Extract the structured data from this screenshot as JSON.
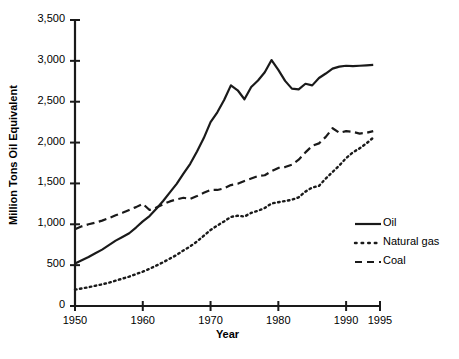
{
  "chart_data": {
    "type": "line",
    "title": "",
    "xlabel": "Year",
    "ylabel": "Million Tons Oil Equivalent",
    "xlim": [
      1950,
      1995
    ],
    "ylim": [
      0,
      3500
    ],
    "xticks": [
      1950,
      1960,
      1970,
      1980,
      1990,
      1995
    ],
    "xtick_labels": [
      "1950",
      "1960",
      "1970",
      "1980",
      "1990",
      "1995"
    ],
    "yticks": [
      0,
      500,
      1000,
      1500,
      2000,
      2500,
      3000,
      3500
    ],
    "ytick_labels": [
      "0",
      "500",
      "1,000",
      "1,500",
      "2,000",
      "2,500",
      "3,000",
      "3,500"
    ],
    "grid": false,
    "legend_position": "center-right",
    "x": [
      1950,
      1951,
      1952,
      1953,
      1954,
      1955,
      1956,
      1957,
      1958,
      1959,
      1960,
      1961,
      1962,
      1963,
      1964,
      1965,
      1966,
      1967,
      1968,
      1969,
      1970,
      1971,
      1972,
      1973,
      1974,
      1975,
      1976,
      1977,
      1978,
      1979,
      1980,
      1981,
      1982,
      1983,
      1984,
      1985,
      1986,
      1987,
      1988,
      1989,
      1990,
      1991,
      1992,
      1993,
      1994
    ],
    "series": [
      {
        "name": "Oil",
        "style": "solid",
        "color": "#1a1a1a",
        "values": [
          520,
          560,
          600,
          645,
          690,
          745,
          800,
          845,
          890,
          960,
          1035,
          1100,
          1190,
          1285,
          1390,
          1495,
          1620,
          1740,
          1890,
          2055,
          2250,
          2370,
          2520,
          2700,
          2640,
          2530,
          2680,
          2760,
          2860,
          3010,
          2890,
          2755,
          2660,
          2650,
          2720,
          2700,
          2790,
          2845,
          2905,
          2930,
          2940,
          2935,
          2940,
          2945,
          2950
        ]
      },
      {
        "name": "Natural gas",
        "style": "dotted",
        "color": "#1a1a1a",
        "values": [
          200,
          215,
          230,
          248,
          265,
          285,
          310,
          335,
          360,
          390,
          420,
          455,
          495,
          535,
          580,
          625,
          680,
          730,
          790,
          860,
          930,
          985,
          1035,
          1090,
          1105,
          1095,
          1140,
          1165,
          1200,
          1255,
          1270,
          1285,
          1300,
          1330,
          1400,
          1450,
          1470,
          1560,
          1640,
          1720,
          1810,
          1880,
          1930,
          1990,
          2060
        ]
      },
      {
        "name": "Coal",
        "style": "dashed",
        "color": "#1a1a1a",
        "values": [
          940,
          975,
          1000,
          1020,
          1045,
          1075,
          1110,
          1140,
          1175,
          1210,
          1250,
          1175,
          1205,
          1245,
          1280,
          1305,
          1325,
          1310,
          1345,
          1385,
          1420,
          1420,
          1440,
          1480,
          1495,
          1530,
          1560,
          1590,
          1600,
          1650,
          1690,
          1700,
          1730,
          1790,
          1880,
          1960,
          1990,
          2070,
          2175,
          2120,
          2140,
          2130,
          2110,
          2120,
          2140
        ]
      }
    ],
    "legend": [
      {
        "label": "Oil",
        "style": "solid"
      },
      {
        "label": "Natural gas",
        "style": "dotted"
      },
      {
        "label": "Coal",
        "style": "dashed"
      }
    ]
  }
}
